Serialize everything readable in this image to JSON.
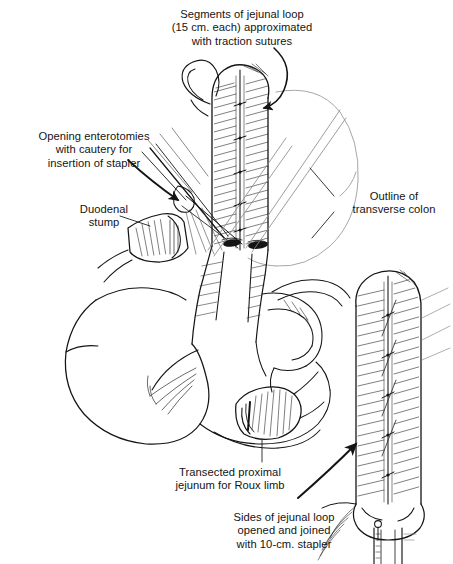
{
  "figure": {
    "background_color": "#ffffff",
    "ink_color": "#141414",
    "faint_ink_color": "#9a9a9a",
    "width": 453,
    "height": 564
  },
  "captions": {
    "segments": "Segments of jejunal loop\n(15 cm. each) approximated\nwith traction sutures",
    "enterotomies": "Opening enterotomies\nwith cautery for\ninsertion of stapler",
    "duodenal_stump": "Duodenal\nstump",
    "transverse_colon": "Outline of\ntransverse colon",
    "transected_jejunum": "Transected proximal\njejunum for Roux limb",
    "sides_joined": "Sides of jejunal loop\nopened and joined\nwith 10-cm. stapler"
  },
  "anatomy": {
    "jejunal_loop_label": "jejunal-loop",
    "duodenal_stump_label": "duodenal-stump",
    "transverse_colon_label": "transverse-colon",
    "roux_limb_label": "roux-limb",
    "stapler_label": "stapler-device",
    "enterotomy_count": 2,
    "traction_suture_count": 5
  },
  "leaders": {
    "segments_arrow": "curved-arrow-down",
    "enterotomies_arrow": "curved-arrow-down-right",
    "duodenal_leader": "straight-leader-line",
    "colon_leader": "straight-leader-line",
    "transected_leader": "straight-leader-line",
    "sides_arrow": "curved-arrow-up-right"
  }
}
